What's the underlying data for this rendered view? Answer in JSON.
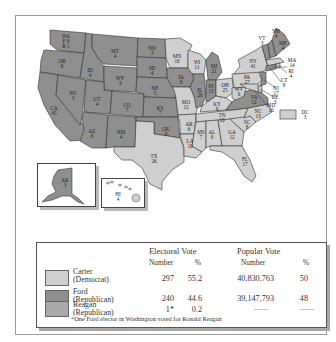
{
  "map": {
    "colors": {
      "ford": "#8f8f8f",
      "carter": "#cfcfcf",
      "reagan": "#a9a9a9",
      "water": "#ffffff",
      "border": "#333333"
    },
    "states": [
      {
        "abbr": "WA",
        "votes": "F 8\nR 1",
        "winner": "ford",
        "label": "WA",
        "sub": "F 8 R 1"
      },
      {
        "abbr": "OR",
        "votes": "6",
        "winner": "ford"
      },
      {
        "abbr": "CA",
        "votes": "45",
        "winner": "ford"
      },
      {
        "abbr": "NV",
        "votes": "3",
        "winner": "ford"
      },
      {
        "abbr": "ID",
        "votes": "4",
        "winner": "ford"
      },
      {
        "abbr": "MT",
        "votes": "4",
        "winner": "ford"
      },
      {
        "abbr": "WY",
        "votes": "3",
        "winner": "ford"
      },
      {
        "abbr": "UT",
        "votes": "4",
        "winner": "ford"
      },
      {
        "abbr": "CO",
        "votes": "7",
        "winner": "ford"
      },
      {
        "abbr": "AZ",
        "votes": "6",
        "winner": "ford"
      },
      {
        "abbr": "NM",
        "votes": "4",
        "winner": "ford"
      },
      {
        "abbr": "ND",
        "votes": "3",
        "winner": "ford"
      },
      {
        "abbr": "SD",
        "votes": "4",
        "winner": "ford"
      },
      {
        "abbr": "NE",
        "votes": "5",
        "winner": "ford"
      },
      {
        "abbr": "KS",
        "votes": "7",
        "winner": "ford"
      },
      {
        "abbr": "OK",
        "votes": "8",
        "winner": "ford"
      },
      {
        "abbr": "TX",
        "votes": "26",
        "winner": "carter"
      },
      {
        "abbr": "MN",
        "votes": "10",
        "winner": "carter"
      },
      {
        "abbr": "IA",
        "votes": "8",
        "winner": "ford"
      },
      {
        "abbr": "MO",
        "votes": "12",
        "winner": "carter"
      },
      {
        "abbr": "AR",
        "votes": "6",
        "winner": "carter"
      },
      {
        "abbr": "LA",
        "votes": "10",
        "winner": "carter"
      },
      {
        "abbr": "WI",
        "votes": "11",
        "winner": "carter"
      },
      {
        "abbr": "IL",
        "votes": "26",
        "winner": "ford"
      },
      {
        "abbr": "MI",
        "votes": "21",
        "winner": "ford"
      },
      {
        "abbr": "IN",
        "votes": "13",
        "winner": "ford"
      },
      {
        "abbr": "OH",
        "votes": "25",
        "winner": "carter"
      },
      {
        "abbr": "KY",
        "votes": "9",
        "winner": "carter"
      },
      {
        "abbr": "TN",
        "votes": "10",
        "winner": "carter"
      },
      {
        "abbr": "MS",
        "votes": "7",
        "winner": "carter"
      },
      {
        "abbr": "AL",
        "votes": "9",
        "winner": "carter"
      },
      {
        "abbr": "GA",
        "votes": "12",
        "winner": "carter"
      },
      {
        "abbr": "FL",
        "votes": "17",
        "winner": "carter"
      },
      {
        "abbr": "SC",
        "votes": "8",
        "winner": "carter"
      },
      {
        "abbr": "NC",
        "votes": "13",
        "winner": "carter"
      },
      {
        "abbr": "VA",
        "votes": "12",
        "winner": "ford"
      },
      {
        "abbr": "WV",
        "votes": "6",
        "winner": "carter"
      },
      {
        "abbr": "PA",
        "votes": "27",
        "winner": "carter"
      },
      {
        "abbr": "NY",
        "votes": "41",
        "winner": "carter"
      },
      {
        "abbr": "VT",
        "votes": "3",
        "winner": "ford"
      },
      {
        "abbr": "NH",
        "votes": "4",
        "winner": "ford"
      },
      {
        "abbr": "ME",
        "votes": "4",
        "winner": "ford"
      },
      {
        "abbr": "MA",
        "votes": "14",
        "winner": "carter"
      },
      {
        "abbr": "RI",
        "votes": "4",
        "winner": "carter"
      },
      {
        "abbr": "CT",
        "votes": "8",
        "winner": "ford"
      },
      {
        "abbr": "NJ",
        "votes": "17",
        "winner": "ford"
      },
      {
        "abbr": "DE",
        "votes": "3",
        "winner": "carter"
      },
      {
        "abbr": "MD",
        "votes": "10",
        "winner": "carter"
      },
      {
        "abbr": "DC",
        "votes": "3",
        "winner": "carter"
      },
      {
        "abbr": "AK",
        "votes": "3",
        "winner": "ford"
      },
      {
        "abbr": "HI",
        "votes": "4",
        "winner": "carter"
      }
    ]
  },
  "legend": {
    "headers": {
      "electoral": "Electoral Vote",
      "popular": "Popular Vote",
      "number": "Number",
      "percent": "%",
      "pop_number": "Number",
      "pop_percent": "%"
    },
    "rows": [
      {
        "name": "Carter",
        "party": "(Democrat)",
        "ev": "297",
        "ev_pct": "55.2",
        "pv": "40,830,763",
        "pv_pct": "50",
        "color": "#cfcfcf"
      },
      {
        "name": "Ford",
        "party": "(Republican)",
        "ev": "240",
        "ev_pct": "44.6",
        "pv": "39,147,793",
        "pv_pct": "48",
        "color": "#8f8f8f"
      },
      {
        "name": "Reagan",
        "party": "(Republican)",
        "ev": "1*",
        "ev_pct": "0.2",
        "pv": "-----",
        "pv_pct": "-----",
        "color": "#a9a9a9"
      }
    ],
    "footnote": "*One Ford elector in Washington voted for Ronald Reagan"
  }
}
